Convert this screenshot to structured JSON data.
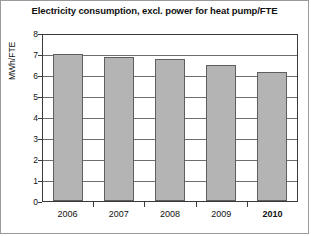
{
  "chart_data": {
    "type": "bar",
    "title": "Electricity consumption, excl. power for heat pump/FTE",
    "xlabel": "",
    "ylabel": "MWh/FTE",
    "categories": [
      "2006",
      "2007",
      "2008",
      "2009",
      "2010"
    ],
    "values": [
      7.0,
      6.85,
      6.75,
      6.5,
      6.15
    ],
    "ylim": [
      0,
      8
    ],
    "ytick_labels": [
      "8",
      "7",
      "6",
      "5",
      "4",
      "3",
      "2",
      "1",
      "0"
    ],
    "ytick_values": [
      8,
      7,
      6,
      5,
      4,
      3,
      2,
      1,
      0
    ],
    "grid": true,
    "legend": false,
    "highlight_category": "2010",
    "colors": {
      "bar_fill": "#b4b4b4",
      "bar_edge": "#5e5e5e",
      "axis": "#3a3a3a",
      "gridline": "#6e6e6e",
      "text": "#111111",
      "background": "#ffffff",
      "frame": "#9a9a9a"
    }
  }
}
